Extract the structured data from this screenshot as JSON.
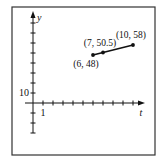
{
  "chart_data": {
    "type": "line",
    "title": "",
    "xlabel": "t",
    "ylabel": "y",
    "x_tick_label": "1",
    "y_tick_label": "10",
    "x_tick_step": 1,
    "y_tick_step": 10,
    "xlim": [
      -1,
      11
    ],
    "ylim": [
      -30,
      90
    ],
    "grid": false,
    "series": [
      {
        "name": "segment",
        "points": [
          {
            "x": 6,
            "y": 48,
            "label": "(6, 48)"
          },
          {
            "x": 7,
            "y": 50.5,
            "label": "(7, 50.5)"
          },
          {
            "x": 10,
            "y": 58,
            "label": "(10, 58)"
          }
        ]
      }
    ],
    "colors": {
      "line": "#111111",
      "axis": "#111111",
      "frame": "#333333"
    }
  }
}
